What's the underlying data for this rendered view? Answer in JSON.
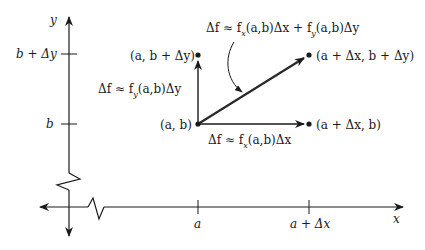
{
  "diagram": {
    "title": "",
    "axes": {
      "x_label": "x",
      "y_label": "y",
      "x_ticks": [
        {
          "label": "a"
        },
        {
          "label": "a + Δx"
        }
      ],
      "y_ticks": [
        {
          "label": "b + Δy"
        },
        {
          "label": "b"
        }
      ]
    },
    "points": {
      "base": "(a, b)",
      "right": "(a + Δx, b)",
      "top": "(a, b + Δy)",
      "diagonal": "(a + Δx, b + Δy)"
    },
    "annotations": {
      "vertical_prefix": "Δf ≈ f",
      "vertical_sub": "y",
      "vertical_suffix": "(a,b)Δy",
      "horizontal_prefix": "Δf ≈ f",
      "horizontal_sub": "x",
      "horizontal_suffix": "(a,b)Δx",
      "diagonal_prefix": "Δf ≈ f",
      "diagonal_sub1": "x",
      "diagonal_mid": "(a,b)Δx + f",
      "diagonal_sub2": "y",
      "diagonal_suffix": "(a,b)Δy"
    },
    "colors": {
      "stroke": "#1a1a1a",
      "diagonal_vector": "#2a2a2a",
      "background": "#ffffff"
    }
  }
}
